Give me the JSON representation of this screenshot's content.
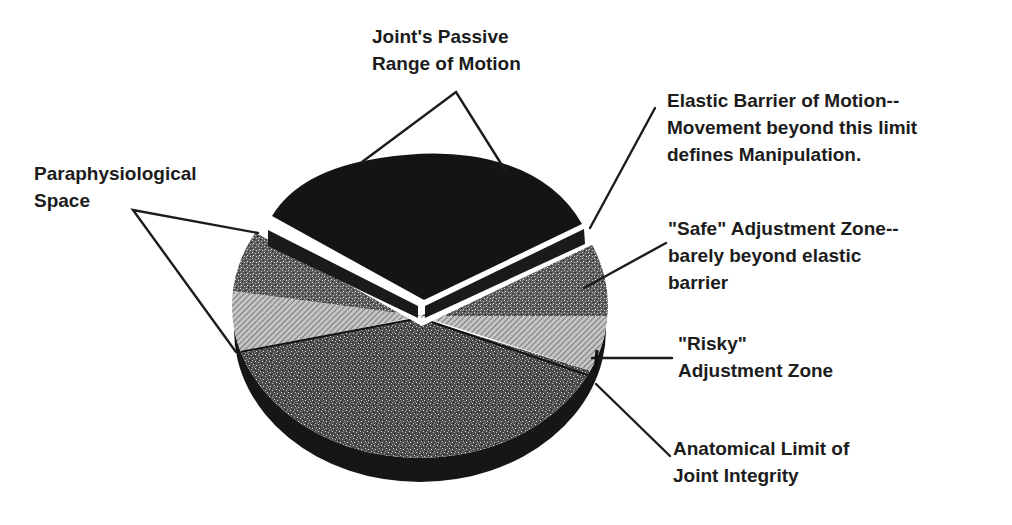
{
  "diagram": {
    "colors": {
      "background": "#ffffff",
      "ink": "#1c1c1c",
      "passive_range": "#141414",
      "barrier_strip": "#1a1a1a",
      "safe_zone": "#5a5a5a",
      "risky_zone": "#a8a8a8",
      "paraphysiological": "#4a4a4a",
      "shadow": "#161616"
    },
    "labels": {
      "passive_range": {
        "line1": "Joint's Passive",
        "line2": "Range of Motion"
      },
      "elastic_barrier": {
        "line1": "Elastic Barrier of Motion--",
        "line2": "Movement beyond this limit",
        "line3": "defines Manipulation."
      },
      "paraphysiological": {
        "line1": "Paraphysiological",
        "line2": "Space"
      },
      "safe_zone": {
        "line1": "\"Safe\" Adjustment Zone--",
        "line2": "barely beyond elastic",
        "line3": "barrier"
      },
      "risky_zone": {
        "line1": "\"Risky\"",
        "line2": "Adjustment Zone"
      },
      "anatomical_limit": {
        "line1": "Anatomical Limit of",
        "line2": "Joint Integrity"
      }
    },
    "segments": [
      {
        "id": "passive_range",
        "name": "Joint's Passive Range of Motion",
        "fill": "solid-black"
      },
      {
        "id": "elastic_barrier",
        "name": "Elastic Barrier of Motion",
        "fill": "black-strip"
      },
      {
        "id": "safe_zone",
        "name": "\"Safe\" Adjustment Zone",
        "fill": "dark-speckle"
      },
      {
        "id": "risky_zone",
        "name": "\"Risky\" Adjustment Zone",
        "fill": "diagonal-hatch"
      },
      {
        "id": "paraphysiological",
        "name": "Paraphysiological Space",
        "fill": "dense-speckle"
      },
      {
        "id": "anatomical_limit",
        "name": "Anatomical Limit of Joint Integrity",
        "fill": "boundary-line"
      }
    ]
  }
}
